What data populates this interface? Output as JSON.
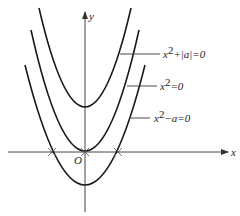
{
  "diagram": {
    "type": "coordinate-graph",
    "axes": {
      "x_label": "x",
      "y_label": "y",
      "origin_label": "O"
    },
    "curves": [
      {
        "name": "upper-parabola",
        "label_main": "x",
        "label_sup": "2",
        "label_rest": "+|a|=0",
        "vertex_note": "above origin"
      },
      {
        "name": "middle-parabola",
        "label_main": "x",
        "label_sup": "2",
        "label_rest": "=0",
        "vertex_note": "at origin"
      },
      {
        "name": "lower-parabola",
        "label_main": "x",
        "label_sup": "2",
        "label_rest": "−a=0",
        "vertex_note": "below origin, crosses x-axis twice"
      }
    ],
    "colors": {
      "stroke": "#1a1a1a",
      "axis": "#444444"
    }
  }
}
